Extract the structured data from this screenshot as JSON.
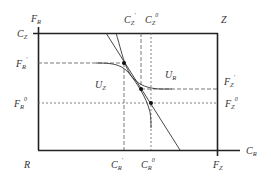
{
  "diagram": {
    "type": "edgeworth-box",
    "colors": {
      "axis": "#222222",
      "curve": "#333333",
      "dashed": "#555555",
      "point": "#111111",
      "label": "#333333"
    },
    "origins": {
      "R": {
        "text": "R"
      },
      "Z": {
        "text": "Z"
      }
    },
    "axes": {
      "left_vertical": {
        "base": "F",
        "sub": "R",
        "sup": ""
      },
      "bottom_horizontal": {
        "base": "C",
        "sub": "R",
        "sup": ""
      },
      "top_left": {
        "base": "C",
        "sub": "Z",
        "sup": ""
      },
      "bottom_right": {
        "base": "F",
        "sub": "Z",
        "sup": ""
      }
    },
    "tick_labels": {
      "cz_prime": {
        "base": "C",
        "sub": "Z",
        "sup": "'"
      },
      "cz_zero": {
        "base": "C",
        "sub": "Z",
        "sup": "0"
      },
      "fr_prime": {
        "base": "F",
        "sub": "R",
        "sup": "'"
      },
      "fr_zero": {
        "base": "F",
        "sub": "R",
        "sup": "0"
      },
      "fz_prime": {
        "base": "F",
        "sub": "Z",
        "sup": "'"
      },
      "fz_zero": {
        "base": "F",
        "sub": "Z",
        "sup": "0"
      },
      "cr_prime": {
        "base": "C",
        "sub": "R",
        "sup": "'"
      },
      "cr_zero": {
        "base": "C",
        "sub": "R",
        "sup": "0"
      }
    },
    "curves": {
      "uz": {
        "base": "U",
        "sub": "Z"
      },
      "ur": {
        "base": "U",
        "sub": "R"
      }
    }
  }
}
